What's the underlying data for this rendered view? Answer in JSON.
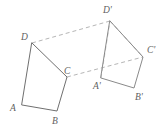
{
  "figure": {
    "background_color": "#ffffff",
    "solid_stroke_color": "#6f6f6f",
    "dashed_stroke_color": "#b4b4b4",
    "label_color": "#5f5f5f",
    "stroke_width": 1,
    "canvas": {
      "width": 166,
      "height": 131
    },
    "shapes": [
      {
        "name": "preimage-quadrilateral",
        "style": "solid",
        "points": "22,105 57,111 67,77 32,43",
        "vertices": [
          {
            "id": "A",
            "label": "A",
            "x": 22,
            "y": 105,
            "label_x": 10,
            "label_y": 103
          },
          {
            "id": "B",
            "label": "B",
            "x": 57,
            "y": 111,
            "label_x": 52,
            "label_y": 116
          },
          {
            "id": "C",
            "label": "C",
            "x": 67,
            "y": 77,
            "label_x": 64,
            "label_y": 66
          },
          {
            "id": "D",
            "label": "D",
            "x": 32,
            "y": 43,
            "label_x": 21,
            "label_y": 32
          }
        ]
      },
      {
        "name": "image-quadrilateral",
        "style": "solid",
        "points": "101,78 134,88 143,57 110,21",
        "vertices": [
          {
            "id": "Aprime",
            "label": "A'",
            "x": 101,
            "y": 78,
            "label_x": 93,
            "label_y": 81
          },
          {
            "id": "Bprime",
            "label": "B'",
            "x": 134,
            "y": 88,
            "label_x": 135,
            "label_y": 92
          },
          {
            "id": "Cprime",
            "label": "C'",
            "x": 143,
            "y": 57,
            "label_x": 147,
            "label_y": 45
          },
          {
            "id": "Dprime",
            "label": "D'",
            "x": 110,
            "y": 21,
            "label_x": 103,
            "label_y": 5
          }
        ]
      }
    ],
    "connectors": [
      {
        "name": "connector-D-Dprime",
        "style": "dashed",
        "x1": 32,
        "y1": 43,
        "x2": 110,
        "y2": 21
      },
      {
        "name": "connector-C-Cprime",
        "style": "dashed",
        "x1": 67,
        "y1": 77,
        "x2": 143,
        "y2": 57
      },
      {
        "name": "connector-Dprime-Cprime",
        "style": "dashed",
        "x1": 110,
        "y1": 21,
        "x2": 143,
        "y2": 57
      },
      {
        "name": "connector-Aprime-Dprime",
        "style": "dashed-vertical",
        "x1": 101,
        "y1": 78,
        "x2": 110,
        "y2": 21
      }
    ]
  }
}
